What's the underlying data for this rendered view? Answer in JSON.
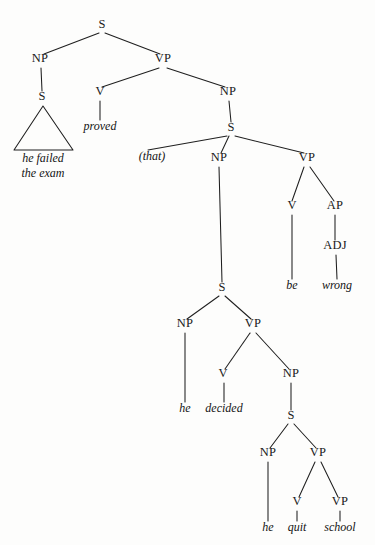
{
  "figure": {
    "type": "syntax-tree",
    "sentence": "he failed the exam proved (that) he decided he quit school be wrong",
    "ink_color": "#1f1f1f",
    "background_color": "#fdfdfc"
  },
  "nodes": [
    {
      "id": "s-root",
      "label": "S",
      "x": 102,
      "y": 28,
      "kind": "nonterminal"
    },
    {
      "id": "np-1",
      "label": "NP",
      "x": 40,
      "y": 62,
      "kind": "nonterminal"
    },
    {
      "id": "s-2",
      "label": "S",
      "x": 42,
      "y": 100,
      "kind": "nonterminal"
    },
    {
      "id": "vp-1",
      "label": "VP",
      "x": 163,
      "y": 62,
      "kind": "nonterminal"
    },
    {
      "id": "v-1",
      "label": "V",
      "x": 100,
      "y": 95,
      "kind": "nonterminal"
    },
    {
      "id": "np-2",
      "label": "NP",
      "x": 228,
      "y": 95,
      "kind": "nonterminal"
    },
    {
      "id": "s-3",
      "label": "S",
      "x": 231,
      "y": 131,
      "kind": "nonterminal"
    },
    {
      "id": "np-3",
      "label": "NP",
      "x": 219,
      "y": 161,
      "kind": "nonterminal"
    },
    {
      "id": "vp-2",
      "label": "VP",
      "x": 307,
      "y": 161,
      "kind": "nonterminal"
    },
    {
      "id": "v-2",
      "label": "V",
      "x": 292,
      "y": 209,
      "kind": "nonterminal"
    },
    {
      "id": "ap-1",
      "label": "AP",
      "x": 335,
      "y": 209,
      "kind": "nonterminal"
    },
    {
      "id": "adj-1",
      "label": "ADJ",
      "x": 335,
      "y": 249,
      "kind": "nonterminal"
    },
    {
      "id": "s-4",
      "label": "S",
      "x": 222,
      "y": 291,
      "kind": "nonterminal"
    },
    {
      "id": "np-4",
      "label": "NP",
      "x": 185,
      "y": 327,
      "kind": "nonterminal"
    },
    {
      "id": "vp-3",
      "label": "VP",
      "x": 253,
      "y": 327,
      "kind": "nonterminal"
    },
    {
      "id": "v-3",
      "label": "V",
      "x": 223,
      "y": 377,
      "kind": "nonterminal"
    },
    {
      "id": "np-5",
      "label": "NP",
      "x": 291,
      "y": 377,
      "kind": "nonterminal"
    },
    {
      "id": "s-5",
      "label": "S",
      "x": 291,
      "y": 419,
      "kind": "nonterminal"
    },
    {
      "id": "np-6",
      "label": "NP",
      "x": 268,
      "y": 456,
      "kind": "nonterminal"
    },
    {
      "id": "vp-4",
      "label": "VP",
      "x": 318,
      "y": 456,
      "kind": "nonterminal"
    },
    {
      "id": "v-4",
      "label": "V",
      "x": 297,
      "y": 505,
      "kind": "nonterminal"
    },
    {
      "id": "vp-5",
      "label": "VP",
      "x": 340,
      "y": 505,
      "kind": "nonterminal"
    }
  ],
  "terminals": [
    {
      "id": "t-that",
      "label": "(that)",
      "x": 152,
      "y": 160
    },
    {
      "id": "t-proved",
      "label": "proved",
      "x": 100,
      "y": 130
    },
    {
      "id": "t-be",
      "label": "be",
      "x": 292,
      "y": 289
    },
    {
      "id": "t-wrong",
      "label": "wrong",
      "x": 337,
      "y": 289
    },
    {
      "id": "t-he-1",
      "label": "he",
      "x": 185,
      "y": 412
    },
    {
      "id": "t-decided",
      "label": "decided",
      "x": 224,
      "y": 412
    },
    {
      "id": "t-he-2",
      "label": "he",
      "x": 268,
      "y": 531
    },
    {
      "id": "t-quit",
      "label": "quit",
      "x": 297,
      "y": 531
    },
    {
      "id": "t-school",
      "label": "school",
      "x": 340,
      "y": 531
    }
  ],
  "triangle_text": [
    {
      "id": "tri-line-1",
      "label": "he failed",
      "x": 43,
      "y": 162
    },
    {
      "id": "tri-line-2",
      "label": "the exam",
      "x": 43,
      "y": 177
    }
  ],
  "edges": [
    {
      "id": "e-root-np1",
      "from": "s-root",
      "to": "np-1",
      "x1": 99,
      "y1": 33,
      "x2": 44,
      "y2": 54
    },
    {
      "id": "e-root-vp1",
      "from": "s-root",
      "to": "vp-1",
      "x1": 105,
      "y1": 33,
      "x2": 160,
      "y2": 54
    },
    {
      "id": "e-np1-s2",
      "from": "np-1",
      "to": "s-2",
      "x1": 41,
      "y1": 68,
      "x2": 42,
      "y2": 91
    },
    {
      "id": "e-vp1-v1",
      "from": "vp-1",
      "to": "v-1",
      "x1": 159,
      "y1": 68,
      "x2": 102,
      "y2": 87
    },
    {
      "id": "e-vp1-np2",
      "from": "vp-1",
      "to": "np-2",
      "x1": 167,
      "y1": 68,
      "x2": 225,
      "y2": 87
    },
    {
      "id": "e-v1-proved",
      "from": "v-1",
      "to": "t-proved",
      "x1": 100,
      "y1": 101,
      "x2": 100,
      "y2": 120
    },
    {
      "id": "e-np2-s3",
      "from": "np-2",
      "to": "s-3",
      "x1": 229,
      "y1": 101,
      "x2": 231,
      "y2": 122
    },
    {
      "id": "e-s3-that",
      "from": "s-3",
      "to": "t-that",
      "x1": 227,
      "y1": 136,
      "x2": 148,
      "y2": 150
    },
    {
      "id": "e-s3-np3",
      "from": "s-3",
      "to": "np-3",
      "x1": 229,
      "y1": 136,
      "x2": 221,
      "y2": 153
    },
    {
      "id": "e-s3-vp2",
      "from": "s-3",
      "to": "vp-2",
      "x1": 235,
      "y1": 136,
      "x2": 304,
      "y2": 153
    },
    {
      "id": "e-vp2-v2",
      "from": "vp-2",
      "to": "v-2",
      "x1": 304,
      "y1": 167,
      "x2": 292,
      "y2": 201
    },
    {
      "id": "e-vp2-ap1",
      "from": "vp-2",
      "to": "ap-1",
      "x1": 310,
      "y1": 167,
      "x2": 334,
      "y2": 201
    },
    {
      "id": "e-v2-be",
      "from": "v-2",
      "to": "t-be",
      "x1": 292,
      "y1": 215,
      "x2": 292,
      "y2": 279
    },
    {
      "id": "e-ap1-adj1",
      "from": "ap-1",
      "to": "adj-1",
      "x1": 335,
      "y1": 215,
      "x2": 335,
      "y2": 240
    },
    {
      "id": "e-adj1-wrong",
      "from": "adj-1",
      "to": "t-wrong",
      "x1": 336,
      "y1": 255,
      "x2": 337,
      "y2": 279
    },
    {
      "id": "e-np3-s4",
      "from": "np-3",
      "to": "s-4",
      "x1": 219,
      "y1": 167,
      "x2": 222,
      "y2": 282
    },
    {
      "id": "e-s4-np4",
      "from": "s-4",
      "to": "np-4",
      "x1": 219,
      "y1": 296,
      "x2": 187,
      "y2": 319
    },
    {
      "id": "e-s4-vp3",
      "from": "s-4",
      "to": "vp-3",
      "x1": 225,
      "y1": 296,
      "x2": 251,
      "y2": 319
    },
    {
      "id": "e-np4-he1",
      "from": "np-4",
      "to": "t-he-1",
      "x1": 185,
      "y1": 333,
      "x2": 185,
      "y2": 402
    },
    {
      "id": "e-vp3-v3",
      "from": "vp-3",
      "to": "v-3",
      "x1": 250,
      "y1": 333,
      "x2": 225,
      "y2": 369
    },
    {
      "id": "e-vp3-np5",
      "from": "vp-3",
      "to": "np-5",
      "x1": 256,
      "y1": 333,
      "x2": 289,
      "y2": 369
    },
    {
      "id": "e-v3-decided",
      "from": "v-3",
      "to": "t-decided",
      "x1": 224,
      "y1": 383,
      "x2": 224,
      "y2": 402
    },
    {
      "id": "e-np5-s5",
      "from": "np-5",
      "to": "s-5",
      "x1": 291,
      "y1": 383,
      "x2": 291,
      "y2": 410
    },
    {
      "id": "e-s5-np6",
      "from": "s-5",
      "to": "np-6",
      "x1": 288,
      "y1": 424,
      "x2": 270,
      "y2": 448
    },
    {
      "id": "e-s5-vp4",
      "from": "s-5",
      "to": "vp-4",
      "x1": 294,
      "y1": 424,
      "x2": 316,
      "y2": 448
    },
    {
      "id": "e-np6-he2",
      "from": "np-6",
      "to": "t-he-2",
      "x1": 268,
      "y1": 462,
      "x2": 268,
      "y2": 521
    },
    {
      "id": "e-vp4-v4",
      "from": "vp-4",
      "to": "v-4",
      "x1": 315,
      "y1": 462,
      "x2": 299,
      "y2": 497
    },
    {
      "id": "e-vp4-vp5",
      "from": "vp-4",
      "to": "vp-5",
      "x1": 321,
      "y1": 462,
      "x2": 338,
      "y2": 497
    },
    {
      "id": "e-v4-quit",
      "from": "v-4",
      "to": "t-quit",
      "x1": 297,
      "y1": 511,
      "x2": 297,
      "y2": 521
    },
    {
      "id": "e-vp5-school",
      "from": "vp-5",
      "to": "t-school",
      "x1": 340,
      "y1": 511,
      "x2": 340,
      "y2": 521
    }
  ],
  "triangle": {
    "id": "tri-1",
    "under_node": "s-2",
    "apex_x": 43,
    "apex_y": 106,
    "left_x": 14,
    "base_y": 150,
    "right_x": 73
  }
}
